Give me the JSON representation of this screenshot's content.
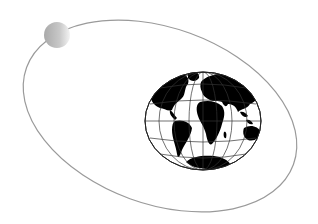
{
  "illustration": {
    "description": "Globe with moon orbiting on elliptical path",
    "background_color": "#ffffff",
    "orbit": {
      "stroke_color": "#9a9a9a"
    },
    "moon": {
      "light_color": "#f2f2f2",
      "dark_color": "#a8a8a8"
    },
    "globe": {
      "land_color": "#000000",
      "grid_color": "#333333",
      "ocean_color": "#ffffff"
    }
  }
}
